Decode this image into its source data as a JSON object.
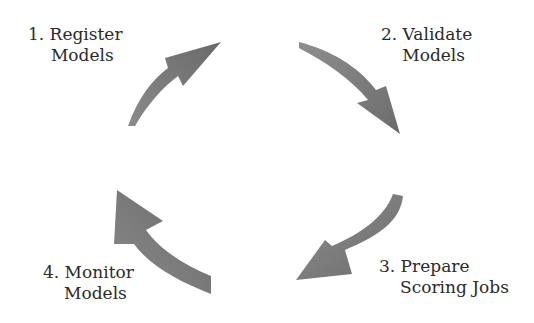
{
  "diagram": {
    "type": "cycle",
    "arrow_color": "#7a7a7a",
    "steps": [
      {
        "number": "1.",
        "line1": "1. Register",
        "line2": "Models"
      },
      {
        "number": "2.",
        "line1": "2. Validate",
        "line2": "Models"
      },
      {
        "number": "3.",
        "line1": "3. Prepare",
        "line2": "Scoring Jobs"
      },
      {
        "number": "4.",
        "line1": "4. Monitor",
        "line2": "Models"
      }
    ]
  }
}
